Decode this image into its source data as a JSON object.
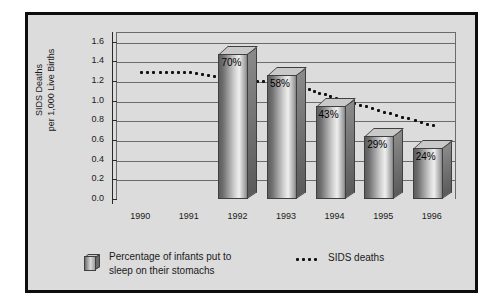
{
  "chart_data": {
    "type": "bar",
    "title": "",
    "xlabel": "",
    "ylabel": "SIDS Deaths per 1,000 Live Births",
    "ylabel_line1": "SIDS Deaths",
    "ylabel_line2": "per 1,000 Live Births",
    "categories": [
      "1990",
      "1991",
      "1992",
      "1993",
      "1994",
      "1995",
      "1996"
    ],
    "ylim": [
      0.0,
      1.7
    ],
    "yticks": [
      "0.0",
      "0.2",
      "0.4",
      "0.6",
      "0.8",
      "1.0",
      "1.2",
      "1.4",
      "1.6"
    ],
    "ytick_values": [
      0.0,
      0.2,
      0.4,
      0.6,
      0.8,
      1.0,
      1.2,
      1.4,
      1.6
    ],
    "grid": true,
    "legend_position": "bottom-left",
    "series": [
      {
        "name": "Percentage of infants put to sleep on their stomachs",
        "type": "bar",
        "unit": "%",
        "labels": [
          "",
          "",
          "70%",
          "58%",
          "43%",
          "29%",
          "24%"
        ],
        "values": [
          null,
          null,
          70,
          58,
          43,
          29,
          24
        ],
        "bar_heights_axis": [
          null,
          null,
          1.48,
          1.26,
          0.95,
          0.64,
          0.52
        ]
      },
      {
        "name": "SIDS deaths",
        "type": "line",
        "style": "dotted",
        "values": [
          1.3,
          1.3,
          1.22,
          1.2,
          1.04,
          0.9,
          0.76
        ]
      }
    ]
  },
  "legend": {
    "bars_label_line1": "Percentage of infants put to",
    "bars_label_line2": "sleep on their stomachs",
    "line_label": "SIDS deaths"
  },
  "colors": {
    "figure_background": "#dcdcdc",
    "border": "#0d0d0d",
    "gridline": "#6b6b6b",
    "axis": "#2a2a2a",
    "text": "#1a1a1a",
    "dot": "#111111",
    "bar_light": "#efefef",
    "bar_dark": "#5d5d5d"
  }
}
